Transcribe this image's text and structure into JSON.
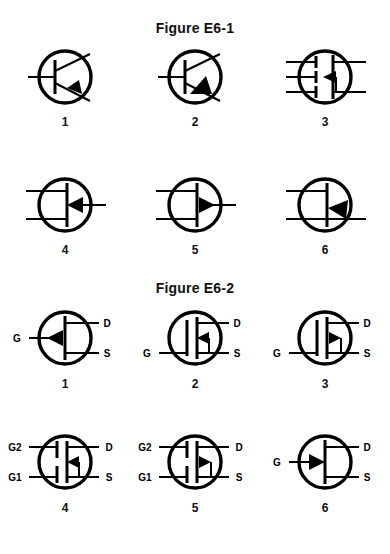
{
  "page": {
    "background": "#ffffff",
    "ink": "#000000",
    "width": 390,
    "height": 554
  },
  "figures": [
    {
      "id": "E6-1",
      "title": "Figure E6-1",
      "rows": [
        {
          "items": [
            {
              "number": "1",
              "type": "bjt",
              "icon_name": "npn-bipolar-transistor-symbol",
              "arrow_direction": "in",
              "terminals": []
            },
            {
              "number": "2",
              "type": "bjt",
              "icon_name": "pnp-bipolar-transistor-symbol",
              "arrow_direction": "out",
              "terminals": []
            },
            {
              "number": "3",
              "type": "mosfet",
              "icon_name": "n-channel-mosfet-symbol",
              "arrow_direction": "left",
              "terminals": []
            }
          ]
        },
        {
          "items": [
            {
              "number": "4",
              "type": "jfet",
              "icon_name": "n-channel-jfet-symbol",
              "arrow_direction": "left",
              "terminals": []
            },
            {
              "number": "5",
              "type": "jfet",
              "icon_name": "p-channel-jfet-symbol",
              "arrow_direction": "right",
              "terminals": []
            },
            {
              "number": "6",
              "type": "ujt",
              "icon_name": "unijunction-transistor-symbol",
              "arrow_direction": "diagonal",
              "terminals": []
            }
          ]
        }
      ]
    },
    {
      "id": "E6-2",
      "title": "Figure E6-2",
      "rows": [
        {
          "items": [
            {
              "number": "1",
              "type": "jfet-gds",
              "icon_name": "n-channel-jfet-gds-symbol",
              "arrow_direction": "left",
              "terminals": [
                "G",
                "D",
                "S"
              ]
            },
            {
              "number": "2",
              "type": "mosfet-gds",
              "icon_name": "n-channel-mosfet-gds-symbol",
              "arrow_direction": "left",
              "terminals": [
                "G",
                "D",
                "S"
              ]
            },
            {
              "number": "3",
              "type": "mosfet-gds",
              "icon_name": "p-channel-mosfet-gds-symbol",
              "arrow_direction": "right",
              "terminals": [
                "G",
                "D",
                "S"
              ]
            }
          ]
        },
        {
          "items": [
            {
              "number": "4",
              "type": "dual-gate-mosfet",
              "icon_name": "dual-gate-n-channel-mosfet-symbol",
              "arrow_direction": "left",
              "terminals": [
                "G2",
                "G1",
                "D",
                "S"
              ]
            },
            {
              "number": "5",
              "type": "dual-gate-mosfet",
              "icon_name": "dual-gate-p-channel-mosfet-symbol",
              "arrow_direction": "right",
              "terminals": [
                "G2",
                "G1",
                "D",
                "S"
              ]
            },
            {
              "number": "6",
              "type": "jfet-gds",
              "icon_name": "p-channel-jfet-gds-symbol",
              "arrow_direction": "right",
              "terminals": [
                "G",
                "D",
                "S"
              ]
            }
          ]
        }
      ]
    }
  ]
}
